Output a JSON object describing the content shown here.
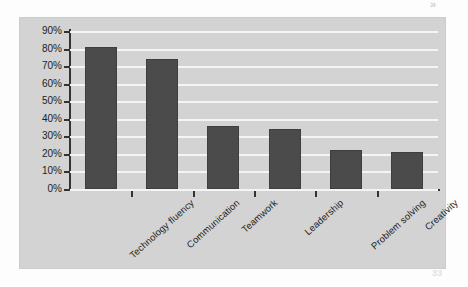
{
  "artifacts": {
    "top_right": "»",
    "bottom_right": "33"
  },
  "colors": {
    "panel_background": "#d3d3d3",
    "bar_fill": "#4b4b4b",
    "gridline": "#f4f4f4",
    "axis": "#333333",
    "text": "#1d1d1d"
  },
  "chart_data": {
    "type": "bar",
    "title": "",
    "xlabel": "",
    "ylabel": "",
    "categories": [
      "Technology fluency",
      "Communication",
      "Teamwork",
      "Leadership",
      "Problem solving",
      "Creativity"
    ],
    "values": [
      81,
      74,
      36,
      34,
      22,
      21
    ],
    "value_suffix": "%",
    "ylim": [
      0,
      90
    ],
    "ytick_labels": [
      "0%",
      "10%",
      "20%",
      "30%",
      "40%",
      "50%",
      "60%",
      "70%",
      "80%",
      "90%"
    ],
    "ytick_values": [
      0,
      10,
      20,
      30,
      40,
      50,
      60,
      70,
      80,
      90
    ],
    "grid": true,
    "grid_axis": "y",
    "legend": false,
    "legend_position": "none",
    "series": [
      {
        "name": "",
        "values": [
          81,
          74,
          36,
          34,
          22,
          21
        ]
      }
    ]
  }
}
